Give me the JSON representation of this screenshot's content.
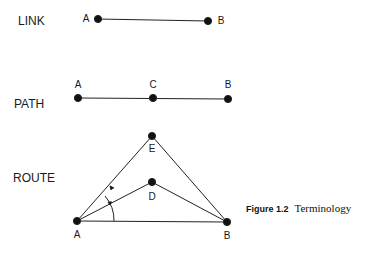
{
  "sections": {
    "link": {
      "label": "LINK",
      "nodes": [
        {
          "id": "A",
          "x": 98,
          "y": 19
        },
        {
          "id": "B",
          "x": 208,
          "y": 21
        }
      ]
    },
    "path": {
      "label": "PATH",
      "nodes": [
        {
          "id": "A",
          "x": 78,
          "y": 98
        },
        {
          "id": "C",
          "x": 153,
          "y": 98
        },
        {
          "id": "B",
          "x": 228,
          "y": 99
        }
      ]
    },
    "route": {
      "label": "ROUTE",
      "nodes": [
        {
          "id": "E",
          "x": 152,
          "y": 136
        },
        {
          "id": "D",
          "x": 152,
          "y": 182
        },
        {
          "id": "A",
          "x": 77,
          "y": 221
        },
        {
          "id": "B",
          "x": 227,
          "y": 222
        }
      ]
    }
  },
  "labels": {
    "link_a": "A",
    "link_b": "B",
    "path_a": "A",
    "path_c": "C",
    "path_b": "B",
    "route_e": "E",
    "route_d": "D",
    "route_a": "A",
    "route_b": "B"
  },
  "caption": {
    "figure": "Figure 1.2",
    "title": "Terminology"
  }
}
